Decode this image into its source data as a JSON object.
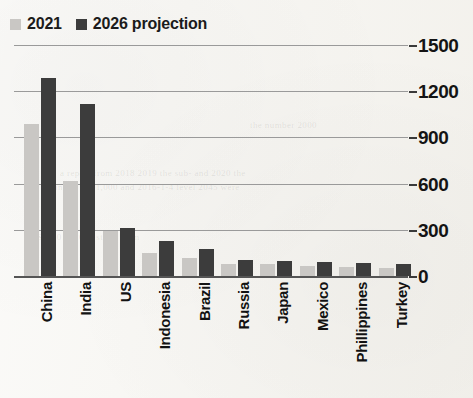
{
  "chart_data": {
    "type": "bar",
    "title": "",
    "xlabel": "",
    "ylabel": "",
    "ylim": [
      0,
      1500
    ],
    "yticks": [
      0,
      300,
      600,
      900,
      1200,
      1500
    ],
    "grid": true,
    "legend_position": "top-left",
    "categories": [
      "China",
      "India",
      "US",
      "Indonesia",
      "Brazil",
      "Russia",
      "Japan",
      "Mexico",
      "Phillippines",
      "Turkey"
    ],
    "series": [
      {
        "name": "2021",
        "color": "#c9c7c4",
        "values": [
          985,
          615,
          290,
          150,
          120,
          80,
          75,
          65,
          60,
          55
        ]
      },
      {
        "name": "2026 projection",
        "color": "#3c3c3c",
        "values": [
          1285,
          1115,
          310,
          230,
          175,
          105,
          100,
          90,
          85,
          75
        ]
      }
    ]
  },
  "legend": {
    "entries": [
      {
        "label": "2021",
        "swatch": "light"
      },
      {
        "label": "2026 projection",
        "swatch": "dark"
      }
    ]
  },
  "axis": {
    "y_labels": [
      "1500",
      "1200",
      "900",
      "600",
      "300",
      "0"
    ]
  },
  "ghost_text": [
    "a report from 2018 2019 the sub-  and 2020 the",
    "in the per 1,000 and 2016-1-4 level 2045 were",
    "USD 2018 2019 study from",
    "the number 2000"
  ]
}
